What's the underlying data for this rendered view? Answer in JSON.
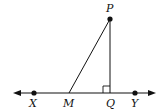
{
  "diagram": {
    "type": "geometry",
    "line_color": "#111111",
    "points": {
      "P": {
        "label": "P",
        "x": 110,
        "y": 19,
        "dot": true
      },
      "X": {
        "label": "X",
        "x": 34,
        "y": 93,
        "dot": true
      },
      "M": {
        "label": "M",
        "x": 69,
        "y": 93,
        "dot": false
      },
      "Q": {
        "label": "Q",
        "x": 110,
        "y": 93,
        "dot": false
      },
      "Y": {
        "label": "Y",
        "x": 135,
        "y": 93,
        "dot": true
      }
    },
    "segments": [
      {
        "from": "P",
        "to": "M"
      },
      {
        "from": "P",
        "to": "Q"
      }
    ],
    "line": {
      "through": [
        "X",
        "Y"
      ],
      "arrows": "both"
    },
    "right_angle_at": "Q"
  }
}
